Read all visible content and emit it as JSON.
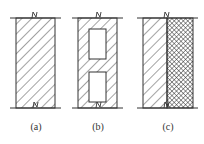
{
  "diagram": {
    "type": "wall-cross-sections",
    "panels": [
      {
        "id": "a",
        "label": "(a)",
        "description": "solid wall with diagonal hatching"
      },
      {
        "id": "b",
        "label": "(b)",
        "description": "hollow wall with two rectangular cavities"
      },
      {
        "id": "c",
        "label": "(c)",
        "description": "composite wall: hatched layer plus cross-hatched insulation layer"
      }
    ],
    "colors": {
      "stroke": "#333333",
      "background": "#ffffff"
    }
  }
}
